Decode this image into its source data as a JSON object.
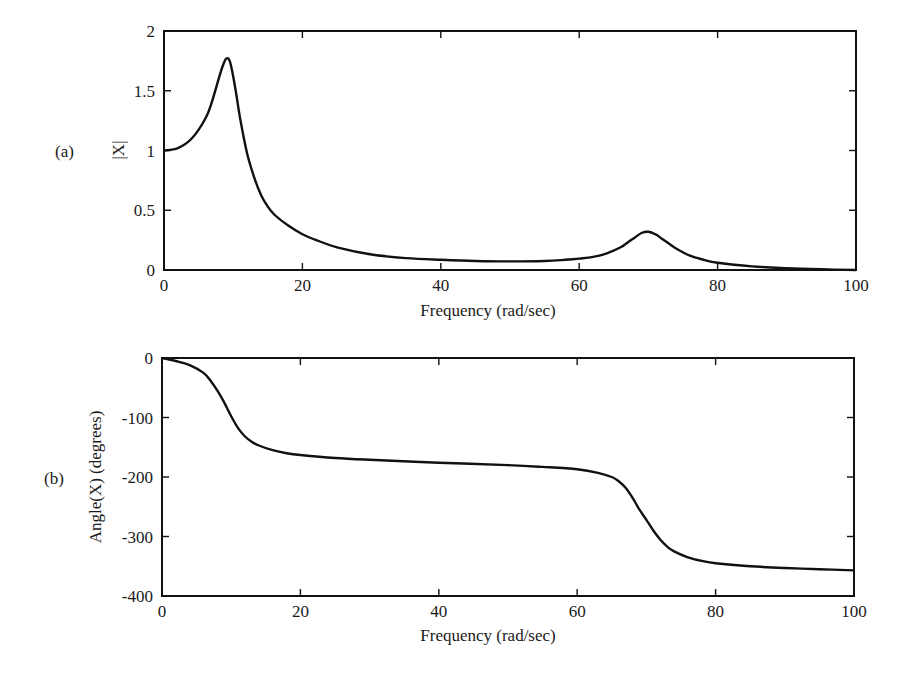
{
  "chart_data": [
    {
      "type": "line",
      "panel_label": "(a)",
      "title": "",
      "xlabel": "Frequency (rad/sec)",
      "ylabel": "|X|",
      "xlim": [
        0,
        100
      ],
      "ylim": [
        0,
        2
      ],
      "xticks": [
        0,
        20,
        40,
        60,
        80,
        100
      ],
      "xtick_labels": [
        "0",
        "20",
        "40",
        "60",
        "80",
        "100"
      ],
      "yticks": [
        0,
        0.5,
        1,
        1.5,
        2
      ],
      "ytick_labels": [
        "0",
        "0.5",
        "1",
        "1.5",
        "2"
      ],
      "grid": false,
      "legend": null,
      "series": [
        {
          "name": "|X|",
          "x": [
            0,
            2,
            4,
            6,
            7,
            8,
            8.5,
            9,
            9.5,
            10,
            10.5,
            11,
            12,
            13,
            14,
            15,
            16,
            18,
            20,
            22,
            25,
            30,
            35,
            40,
            45,
            50,
            55,
            58,
            60,
            62,
            64,
            66,
            67,
            68,
            69,
            70,
            71,
            72,
            73,
            74,
            76,
            78,
            80,
            85,
            90,
            95,
            100
          ],
          "y": [
            1.0,
            1.02,
            1.1,
            1.27,
            1.42,
            1.62,
            1.71,
            1.77,
            1.75,
            1.62,
            1.45,
            1.27,
            0.98,
            0.78,
            0.63,
            0.53,
            0.46,
            0.37,
            0.3,
            0.25,
            0.19,
            0.13,
            0.1,
            0.085,
            0.075,
            0.072,
            0.075,
            0.085,
            0.095,
            0.11,
            0.14,
            0.19,
            0.23,
            0.27,
            0.31,
            0.32,
            0.3,
            0.26,
            0.22,
            0.18,
            0.12,
            0.085,
            0.06,
            0.03,
            0.015,
            0.006,
            0.0
          ]
        }
      ]
    },
    {
      "type": "line",
      "panel_label": "(b)",
      "title": "",
      "xlabel": "Frequency (rad/sec)",
      "ylabel": "Angle(X) (degrees)",
      "xlim": [
        0,
        100
      ],
      "ylim": [
        -400,
        0
      ],
      "xticks": [
        0,
        20,
        40,
        60,
        80,
        100
      ],
      "xtick_labels": [
        "0",
        "20",
        "40",
        "60",
        "80",
        "100"
      ],
      "yticks": [
        0,
        -100,
        -200,
        -300,
        -400
      ],
      "ytick_labels": [
        "0",
        "-100",
        "-200",
        "-300",
        "-400"
      ],
      "grid": false,
      "legend": null,
      "series": [
        {
          "name": "Angle(X)",
          "x": [
            0,
            2,
            4,
            6,
            7,
            8,
            9,
            10,
            11,
            12,
            13,
            14,
            16,
            18,
            20,
            25,
            30,
            40,
            50,
            55,
            60,
            63,
            65,
            66,
            67,
            68,
            69,
            70,
            71,
            72,
            73,
            74,
            76,
            78,
            80,
            85,
            90,
            95,
            100
          ],
          "y": [
            0,
            -5,
            -12,
            -25,
            -38,
            -55,
            -75,
            -98,
            -118,
            -132,
            -141,
            -147,
            -155,
            -160,
            -163,
            -168,
            -171,
            -176,
            -180,
            -183,
            -187,
            -193,
            -200,
            -207,
            -218,
            -235,
            -255,
            -272,
            -290,
            -305,
            -317,
            -325,
            -335,
            -341,
            -345,
            -350,
            -353,
            -355,
            -357
          ]
        }
      ]
    }
  ]
}
